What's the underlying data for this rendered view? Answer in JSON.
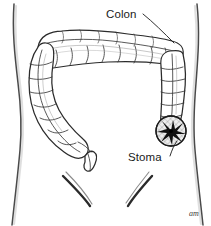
{
  "figure": {
    "style": "pen-and-ink medical illustration",
    "background_color": "#ffffff",
    "line_color": "#2b2b2b",
    "shading_color": "#9a9a9a"
  },
  "labels": [
    {
      "id": "colon",
      "text": "Colon",
      "x": 106,
      "y": 18,
      "leader_from": {
        "x": 143,
        "y": 14
      },
      "leader_to": {
        "x": 174,
        "y": 43
      }
    },
    {
      "id": "stoma",
      "text": "Stoma",
      "x": 128,
      "y": 161,
      "leader_from": {
        "x": 170,
        "y": 156
      },
      "leader_to": {
        "x": 176,
        "y": 141
      }
    }
  ],
  "anatomy": {
    "torso": {
      "name": "abdomen-outline",
      "left_edge_top_x": 13,
      "left_edge_waist_x": 21,
      "left_edge_bottom_x": 14,
      "right_edge_top_x": 197,
      "right_edge_waist_x": 192,
      "right_edge_bottom_x": 200
    },
    "colon_segments": [
      {
        "name": "ascending-colon",
        "side": "image-right"
      },
      {
        "name": "transverse-colon",
        "side": "superior"
      },
      {
        "name": "descending-colon",
        "side": "image-left"
      },
      {
        "name": "sigmoid-colon",
        "side": "image-left-inferior"
      }
    ],
    "stoma": {
      "name": "stoma-opening",
      "center_x": 171,
      "center_y": 131,
      "radius": 15,
      "pattern": "cross-hatched circle with dark radial star aperture",
      "fill_color": "#e8e8e8",
      "star_color": "#101010"
    },
    "creases": [
      {
        "name": "left-groin-crease"
      },
      {
        "name": "right-groin-crease"
      }
    ]
  },
  "signature": {
    "text": "am",
    "x": 189,
    "y": 216
  },
  "icon_names": {
    "colon_leader": "leader-line-icon",
    "stoma_leader": "leader-line-icon",
    "stoma_mark": "stoma-star-icon",
    "signature": "artist-signature-icon"
  }
}
